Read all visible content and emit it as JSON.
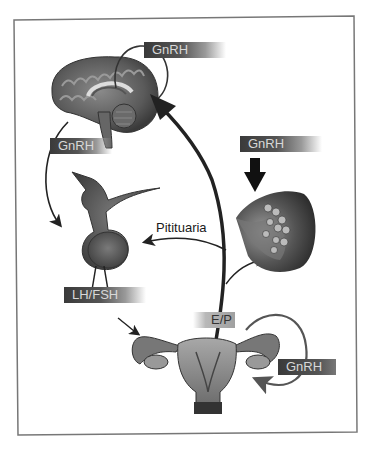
{
  "diagram": {
    "type": "hormonal-axis-illustration",
    "frame_color": "#777777",
    "organs": [
      {
        "id": "brain",
        "name": "brain-hypothalamus"
      },
      {
        "id": "pituitary",
        "name": "pituitary-gland"
      },
      {
        "id": "breast",
        "name": "breast-tissue"
      },
      {
        "id": "uterus",
        "name": "uterus-ovaries"
      }
    ],
    "labels": {
      "gnrh_top": "GnRH",
      "gnrh_left": "GnRH",
      "gnrh_breast": "GnRH",
      "gnrh_ovary": "GnRH",
      "lh_fsh": "LH/FSH",
      "e_p": "E/P",
      "pituitaria": "Pitituaria"
    }
  }
}
